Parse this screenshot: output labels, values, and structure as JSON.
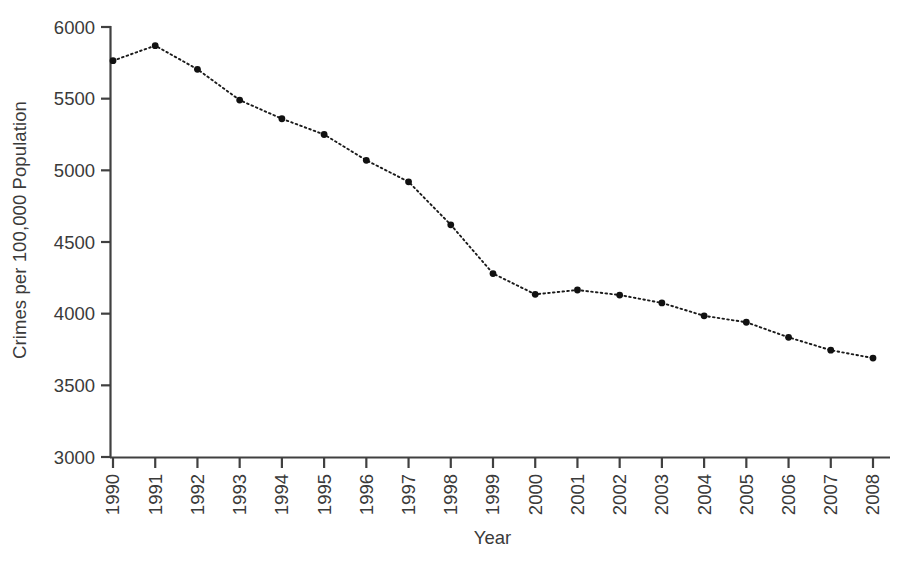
{
  "chart_data": {
    "type": "line",
    "title": "",
    "xlabel": "Year",
    "ylabel": "Crimes per 100,000 Population",
    "categories": [
      "1990",
      "1991",
      "1992",
      "1993",
      "1994",
      "1995",
      "1996",
      "1997",
      "1998",
      "1999",
      "2000",
      "2001",
      "2002",
      "2003",
      "2004",
      "2005",
      "2006",
      "2007",
      "2008"
    ],
    "values": [
      5765,
      5870,
      5705,
      5490,
      5360,
      5250,
      5070,
      4920,
      4620,
      4280,
      4135,
      4165,
      4130,
      4075,
      3985,
      3940,
      3835,
      3745,
      3690
    ],
    "series": [
      {
        "name": "Crime rate",
        "values": [
          5765,
          5870,
          5705,
          5490,
          5360,
          5250,
          5070,
          4920,
          4620,
          4280,
          4135,
          4165,
          4130,
          4075,
          3985,
          3940,
          3835,
          3745,
          3690
        ]
      }
    ],
    "ylim": [
      3000,
      6000
    ],
    "ytick_labels": [
      "3000",
      "3500",
      "4000",
      "4500",
      "5000",
      "5500",
      "6000"
    ],
    "yticks": [
      3000,
      3500,
      4000,
      4500,
      5000,
      5500,
      6000
    ],
    "xtick_labels": [
      "1990",
      "1991",
      "1992",
      "1993",
      "1994",
      "1995",
      "1996",
      "1997",
      "1998",
      "1999",
      "2000",
      "2001",
      "2002",
      "2003",
      "2004",
      "2005",
      "2006",
      "2007",
      "2008"
    ],
    "grid": false,
    "legend": false,
    "legend_position": "none",
    "line_style": "dotted",
    "marker": "filled-circle",
    "xtick_label_rotation": "-90",
    "colors": {
      "line": "#1a1a1a",
      "marker": "#111111",
      "axis": "#404040",
      "text": "#3a3a3a",
      "background": "#ffffff"
    }
  }
}
